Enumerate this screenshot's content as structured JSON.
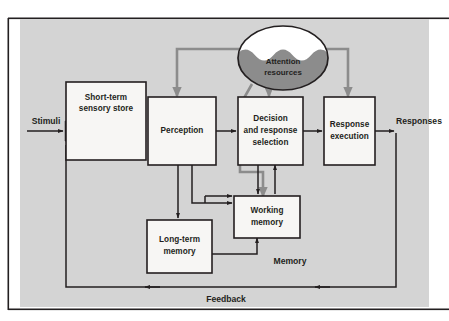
{
  "figure": {
    "panel_background": "#d4d4d4",
    "box_fill": "#f7f6f4",
    "line_color": "#231f20",
    "attention_color": "#8c8c8c",
    "ellipse_top_fill": "#ffffff",
    "ellipse_wave_fill": "#8c8c8c"
  },
  "boxes": {
    "sensory_store": {
      "line1": "Short-term",
      "line2": "sensory store"
    },
    "perception": {
      "line1": "Perception"
    },
    "decision": {
      "line1": "Decision",
      "line2": "and response",
      "line3": "selection"
    },
    "response_execution": {
      "line1": "Response",
      "line2": "execution"
    },
    "working_memory": {
      "line1": "Working",
      "line2": "memory"
    },
    "long_term_memory": {
      "line1": "Long-term",
      "line2": "memory"
    }
  },
  "ellipse": {
    "line1": "Attention",
    "line2": "resources"
  },
  "flow_labels": {
    "stimuli": "Stimuli",
    "responses": "Responses",
    "memory": "Memory",
    "feedback": "Feedback"
  }
}
